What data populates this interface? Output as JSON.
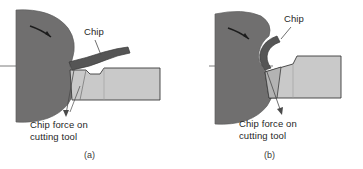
{
  "figure": {
    "type": "technical-diagram",
    "colors": {
      "workpiece": "#706f6f",
      "chip": "#555555",
      "tool_body": "#c9c9c9",
      "tool_insert": "#b3b3b3",
      "outline": "#3b3b3b",
      "leader_line": "#4a4a4a",
      "background": "#ffffff",
      "text": "#262626"
    }
  },
  "panels": [
    {
      "id": "a",
      "caption": "(a)",
      "chip_label": "Chip",
      "force_label_line1": "Chip force on",
      "force_label_line2": "cutting tool",
      "parts": {
        "workpiece": "rotating-workpiece",
        "rotation_arrow": "rotation-direction-arrow",
        "centerline": "workpiece-centerline",
        "chip": "long-curved-chip",
        "tool": "cutting-tool-with-chip-breaker-groove"
      }
    },
    {
      "id": "b",
      "caption": "(b)",
      "chip_label": "Chip",
      "force_label_line1": "Chip force on",
      "force_label_line2": "cutting tool",
      "parts": {
        "workpiece": "rotating-workpiece",
        "rotation_arrow": "rotation-direction-arrow",
        "centerline": "workpiece-centerline",
        "chip": "tight-curled-chip",
        "tool": "cutting-tool-with-chamfered-edge"
      }
    }
  ]
}
